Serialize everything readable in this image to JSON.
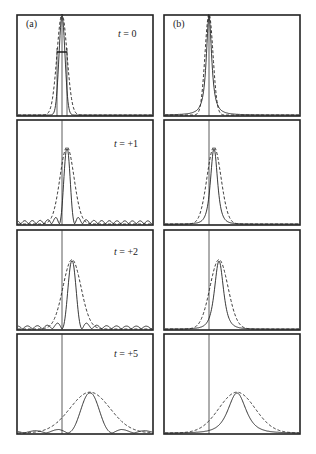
{
  "figure": {
    "columns": [
      {
        "label": "(a)",
        "description": "sinc-like profile (solid) with dashed Gaussian fit"
      },
      {
        "label": "(b)",
        "description": "peaked profile (solid) with dashed Gaussian fit"
      }
    ],
    "rows": [
      {
        "time_label": "t = 0",
        "t_var": "t",
        "t_value": "= 0"
      },
      {
        "time_label": "t = +1",
        "t_var": "t",
        "t_value": "= +1"
      },
      {
        "time_label": "t = +2",
        "t_var": "t",
        "t_value": "= +2"
      },
      {
        "time_label": "t = +5",
        "t_var": "t",
        "t_value": "= +5"
      }
    ]
  },
  "chart_data": [
    {
      "type": "line",
      "panel": "(a) t=0",
      "title": "t = 0",
      "series": [
        {
          "name": "solid",
          "style": "solid"
        },
        {
          "name": "fit",
          "style": "dashed"
        }
      ],
      "peak_x_offset": 0,
      "annotation": "width marker (double arrow) at half maximum",
      "grid": false
    },
    {
      "type": "line",
      "panel": "(b) t=0",
      "series": [
        {
          "name": "solid",
          "style": "solid"
        },
        {
          "name": "fit",
          "style": "dashed"
        }
      ],
      "peak_x_offset": 0,
      "grid": false
    },
    {
      "type": "line",
      "panel": "(a) t=+1",
      "title": "t = +1",
      "series": [
        {
          "name": "solid",
          "style": "solid",
          "sidelobes": true
        },
        {
          "name": "fit",
          "style": "dashed"
        }
      ],
      "peak_x_offset": 0.1,
      "grid": false
    },
    {
      "type": "line",
      "panel": "(b) t=+1",
      "series": [
        {
          "name": "solid",
          "style": "solid"
        },
        {
          "name": "fit",
          "style": "dashed"
        }
      ],
      "peak_x_offset": 0.1,
      "grid": false
    },
    {
      "type": "line",
      "panel": "(a) t=+2",
      "title": "t = +2",
      "series": [
        {
          "name": "solid",
          "style": "solid",
          "sidelobes": true
        },
        {
          "name": "fit",
          "style": "dashed"
        }
      ],
      "peak_x_offset": 0.2,
      "grid": false
    },
    {
      "type": "line",
      "panel": "(b) t=+2",
      "series": [
        {
          "name": "solid",
          "style": "solid"
        },
        {
          "name": "fit",
          "style": "dashed"
        }
      ],
      "peak_x_offset": 0.2,
      "grid": false
    },
    {
      "type": "line",
      "panel": "(a) t=+5",
      "title": "t = +5",
      "series": [
        {
          "name": "solid",
          "style": "solid",
          "sidelobes": true
        },
        {
          "name": "fit",
          "style": "dashed"
        }
      ],
      "peak_x_offset": 0.5,
      "grid": false
    },
    {
      "type": "line",
      "panel": "(b) t=+5",
      "series": [
        {
          "name": "solid",
          "style": "solid"
        },
        {
          "name": "fit",
          "style": "dashed"
        }
      ],
      "peak_x_offset": 0.5,
      "grid": false
    }
  ]
}
